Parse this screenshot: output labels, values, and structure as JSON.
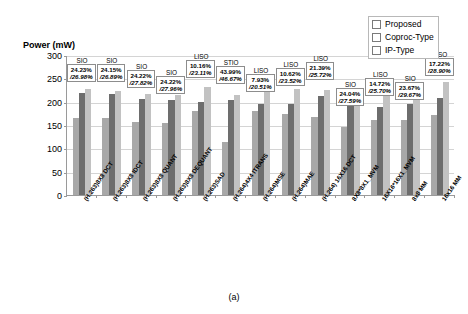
{
  "figure": {
    "caption": "(a)",
    "y_axis_title": "Power (mW)"
  },
  "legend": {
    "position": "top-right",
    "items": [
      {
        "label": "Proposed",
        "color": "#a8a8a8"
      },
      {
        "label": "Coproc-Type",
        "color": "#6d6d6d"
      },
      {
        "label": "IP-Type",
        "color": "#c2c2c2"
      }
    ]
  },
  "chart_data": {
    "type": "bar",
    "title": "",
    "xlabel": "",
    "ylabel": "Power (mW)",
    "ylim": [
      0,
      300
    ],
    "yticks": [
      0,
      50,
      100,
      150,
      200,
      250,
      300
    ],
    "grid": true,
    "legend_position": "top-right",
    "categories": [
      "(H.263)8X8 DCT",
      "(H.263)8X8 IDCT",
      "(H.263)8X8 QUANT",
      "(H.263)8X8 DEQUANT",
      "(H.263)SAD",
      "(H.264)4X4 ITRANS",
      "(H.264)MSE",
      "(H.264)MAE",
      "(H.264) 16X16 DCT",
      "8X8*8X1_MVM",
      "16X16*16X1_MVM",
      "8x8 MM",
      "16x16 MM"
    ],
    "series": [
      {
        "name": "Proposed",
        "color": "#a8a8a8",
        "values": [
          166,
          164,
          156,
          155,
          179,
          114,
          180,
          174,
          167,
          145,
          161,
          160,
          172
        ]
      },
      {
        "name": "Coproc-Type",
        "color": "#6d6d6d",
        "values": [
          219,
          216,
          206,
          204,
          199,
          203,
          195,
          194,
          212,
          191,
          189,
          196,
          208
        ]
      },
      {
        "name": "IP-Type",
        "color": "#c2c2c2",
        "values": [
          228,
          222,
          216,
          215,
          231,
          214,
          226,
          227,
          225,
          200,
          217,
          228,
          242
        ]
      }
    ],
    "annotations": [
      {
        "category_index": 0,
        "tag": "SIO",
        "line1": "24.23%",
        "line2": "/26.98%"
      },
      {
        "category_index": 1,
        "tag": "SIO",
        "line1": "24.15%",
        "line2": "/26.89%"
      },
      {
        "category_index": 2,
        "tag": "SIO",
        "line1": "24.22%",
        "line2": "/27.82%"
      },
      {
        "category_index": 3,
        "tag": "SIO",
        "line1": "24.22%",
        "line2": "/27.96%"
      },
      {
        "category_index": 4,
        "tag": "LISO",
        "line1": "10.16%",
        "line2": "/23.11%"
      },
      {
        "category_index": 5,
        "tag": "STIO",
        "line1": "43.99%",
        "line2": "/46.67%"
      },
      {
        "category_index": 6,
        "tag": "LISO",
        "line1": "7.93%",
        "line2": "/20.51%"
      },
      {
        "category_index": 7,
        "tag": "LISO",
        "line1": "10.62%",
        "line2": "/23.52%"
      },
      {
        "category_index": 8,
        "tag": "LISO",
        "line1": "21.39%",
        "line2": "/25.72%"
      },
      {
        "category_index": 9,
        "tag": "SIO",
        "line1": "24.04%",
        "line2": "/27.59%"
      },
      {
        "category_index": 10,
        "tag": "LISO",
        "line1": "14.72%",
        "line2": "/25.70%"
      },
      {
        "category_index": 11,
        "tag": "SIO",
        "line1": "23.67%",
        "line2": "/29.67%"
      },
      {
        "category_index": 12,
        "tag": "LISO",
        "line1": "17.22%",
        "line2": "/28.90%"
      }
    ]
  }
}
